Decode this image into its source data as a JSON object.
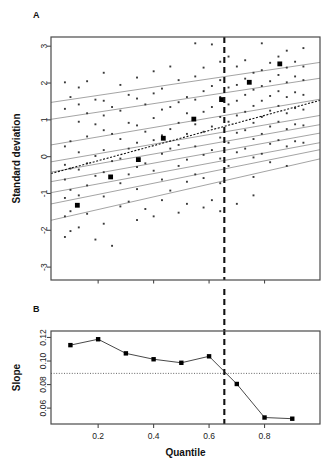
{
  "figure": {
    "panel_a_letter": "A",
    "panel_b_letter": "B",
    "panel_a_ylabel": "Standard deviation",
    "panel_b_ylabel": "Slope",
    "xlabel": "Quantile"
  },
  "chart_data": [
    {
      "id": "panel_a",
      "type": "scatter",
      "title": "A",
      "xlabel": "",
      "ylabel": "Standard deviation",
      "xlim": [
        0.03,
        1.0
      ],
      "ylim": [
        -3.35,
        3.25
      ],
      "yticks": [
        -3,
        -2,
        -1,
        0,
        1,
        2,
        3
      ],
      "ytick_labels": [
        "-3",
        "-2",
        "-1",
        "0",
        "1",
        "2",
        "3"
      ],
      "xticks": [
        0.2,
        0.4,
        0.6,
        0.8
      ],
      "xtick_labels": [],
      "grid": false,
      "legend": "none",
      "annotations": [
        {
          "type": "vline",
          "x": 0.655,
          "style": "dashed",
          "label": "selected quantile threshold"
        }
      ],
      "quantile_lines": [
        {
          "quantile": 0.1,
          "intercept": -1.78,
          "slope": 1.72
        },
        {
          "quantile": 0.2,
          "intercept": -1.33,
          "slope": 1.52
        },
        {
          "quantile": 0.3,
          "intercept": -1.02,
          "slope": 1.4
        },
        {
          "quantile": 0.4,
          "intercept": -0.72,
          "slope": 1.36
        },
        {
          "quantile": 0.5,
          "intercept": -0.46,
          "slope": 1.33
        },
        {
          "quantile": 0.6,
          "intercept": -0.18,
          "slope": 1.3
        },
        {
          "quantile": 0.7,
          "intercept": 0.28,
          "slope": 1.28
        },
        {
          "quantile": 0.8,
          "intercept": 0.98,
          "slope": 1.15
        },
        {
          "quantile": 0.9,
          "intercept": 1.44,
          "slope": 1.12
        }
      ],
      "ols_line": {
        "intercept": -0.52,
        "slope": 2.05,
        "style": "dotted"
      },
      "highlighted_points": [
        {
          "x": 0.125,
          "y": -1.32
        },
        {
          "x": 0.245,
          "y": -0.55
        },
        {
          "x": 0.345,
          "y": -0.08
        },
        {
          "x": 0.435,
          "y": 0.5
        },
        {
          "x": 0.545,
          "y": 1.02
        },
        {
          "x": 0.645,
          "y": 1.55
        },
        {
          "x": 0.745,
          "y": 2.02
        },
        {
          "x": 0.855,
          "y": 2.52
        }
      ],
      "scatter": {
        "x": [
          0.08,
          0.08,
          0.08,
          0.08,
          0.08,
          0.08,
          0.08,
          0.08,
          0.1,
          0.1,
          0.1,
          0.1,
          0.1,
          0.1,
          0.13,
          0.13,
          0.13,
          0.13,
          0.13,
          0.13,
          0.13,
          0.16,
          0.16,
          0.16,
          0.16,
          0.16,
          0.16,
          0.19,
          0.19,
          0.19,
          0.19,
          0.19,
          0.22,
          0.22,
          0.22,
          0.22,
          0.22,
          0.22,
          0.22,
          0.22,
          0.25,
          0.25,
          0.25,
          0.25,
          0.25,
          0.28,
          0.28,
          0.28,
          0.28,
          0.28,
          0.28,
          0.31,
          0.31,
          0.31,
          0.31,
          0.31,
          0.34,
          0.34,
          0.34,
          0.34,
          0.34,
          0.34,
          0.34,
          0.37,
          0.37,
          0.37,
          0.37,
          0.4,
          0.4,
          0.4,
          0.4,
          0.4,
          0.4,
          0.43,
          0.43,
          0.43,
          0.43,
          0.43,
          0.43,
          0.46,
          0.46,
          0.46,
          0.46,
          0.46,
          0.49,
          0.49,
          0.49,
          0.49,
          0.49,
          0.49,
          0.52,
          0.52,
          0.52,
          0.52,
          0.52,
          0.52,
          0.55,
          0.55,
          0.55,
          0.55,
          0.55,
          0.55,
          0.58,
          0.58,
          0.58,
          0.58,
          0.58,
          0.58,
          0.58,
          0.61,
          0.61,
          0.61,
          0.61,
          0.61,
          0.61,
          0.64,
          0.64,
          0.64,
          0.64,
          0.64,
          0.64,
          0.64,
          0.64,
          0.67,
          0.67,
          0.67,
          0.67,
          0.67,
          0.67,
          0.7,
          0.7,
          0.7,
          0.7,
          0.7,
          0.7,
          0.7,
          0.73,
          0.73,
          0.73,
          0.73,
          0.73,
          0.73,
          0.76,
          0.76,
          0.76,
          0.76,
          0.76,
          0.76,
          0.76,
          0.76,
          0.79,
          0.79,
          0.79,
          0.79,
          0.79,
          0.79,
          0.79,
          0.82,
          0.82,
          0.82,
          0.82,
          0.82,
          0.82,
          0.82,
          0.85,
          0.85,
          0.85,
          0.85,
          0.85,
          0.85,
          0.88,
          0.88,
          0.88,
          0.88,
          0.88,
          0.88,
          0.88,
          0.88,
          0.91,
          0.91,
          0.91,
          0.91,
          0.91,
          0.91,
          0.94,
          0.94,
          0.94,
          0.94,
          0.94,
          0.94,
          0.94
        ],
        "y": [
          2.02,
          1.3,
          0.28,
          -0.22,
          -0.62,
          -1.12,
          -1.62,
          -2.18,
          1.62,
          0.42,
          -0.32,
          -0.9,
          -1.48,
          -2.02,
          1.88,
          1.42,
          0.95,
          0.12,
          -0.35,
          -1.05,
          -1.92,
          2.05,
          1.18,
          0.55,
          -0.18,
          -0.78,
          -1.55,
          1.55,
          0.88,
          0.02,
          -0.52,
          -2.25,
          2.28,
          1.52,
          1.12,
          0.72,
          0.18,
          -0.42,
          -1.08,
          -1.82,
          1.35,
          0.62,
          -0.12,
          -0.58,
          -2.42,
          1.95,
          1.25,
          0.48,
          -0.05,
          -0.72,
          -1.35,
          1.68,
          0.92,
          0.22,
          -0.48,
          -1.22,
          2.15,
          1.58,
          0.85,
          0.38,
          -0.28,
          -0.88,
          -1.72,
          1.42,
          0.68,
          -0.18,
          -1.42,
          2.32,
          1.72,
          1.05,
          0.45,
          -0.38,
          -1.62,
          1.85,
          1.28,
          0.58,
          0.08,
          -0.62,
          -1.18,
          2.45,
          1.35,
          0.75,
          0.22,
          -0.92,
          2.08,
          1.48,
          0.92,
          0.32,
          -0.25,
          -1.52,
          1.62,
          1.18,
          0.62,
          -0.08,
          -0.68,
          -1.28,
          3.08,
          2.18,
          1.55,
          0.88,
          0.28,
          -0.48,
          2.42,
          1.78,
          1.22,
          0.68,
          0.05,
          -0.58,
          -1.38,
          3.05,
          1.92,
          1.35,
          0.82,
          0.18,
          -1.18,
          2.58,
          2.08,
          1.62,
          1.08,
          0.52,
          -0.05,
          -0.72,
          -1.48,
          2.72,
          1.88,
          1.42,
          0.95,
          0.38,
          -0.25,
          2.45,
          1.95,
          1.52,
          1.12,
          0.65,
          0.12,
          -1.28,
          2.62,
          2.12,
          1.68,
          1.22,
          0.72,
          0.22,
          2.28,
          1.82,
          1.38,
          0.92,
          0.48,
          -0.02,
          -0.55,
          -1.05,
          3.08,
          2.35,
          1.92,
          1.52,
          1.08,
          0.62,
          0.08,
          2.55,
          2.05,
          1.65,
          1.25,
          0.82,
          0.35,
          -0.15,
          2.72,
          2.22,
          1.78,
          1.38,
          0.95,
          0.45,
          2.88,
          2.42,
          2.02,
          1.62,
          1.18,
          0.75,
          0.28,
          -0.25,
          2.58,
          2.18,
          1.75,
          1.32,
          0.88,
          0.42,
          2.95,
          2.45,
          2.08,
          1.68,
          1.28,
          0.85,
          0.38
        ]
      }
    },
    {
      "id": "panel_b",
      "type": "line",
      "title": "B",
      "xlabel": "Quantile",
      "ylabel": "Slope",
      "xlim": [
        0.03,
        1.0
      ],
      "ylim": [
        0.0465,
        0.1255
      ],
      "yticks": [
        0.06,
        0.08,
        0.1,
        0.12
      ],
      "ytick_labels": [
        "0.06",
        "0.08",
        "0.10",
        "0.12"
      ],
      "xticks": [
        0.2,
        0.4,
        0.6,
        0.8
      ],
      "xtick_labels": [
        "0.2",
        "0.4",
        "0.6",
        "0.8"
      ],
      "grid": false,
      "legend": "none",
      "x": [
        0.1,
        0.2,
        0.3,
        0.4,
        0.5,
        0.6,
        0.7,
        0.8,
        0.9
      ],
      "values": [
        0.1135,
        0.1185,
        0.1065,
        0.1015,
        0.0985,
        0.104,
        0.0805,
        0.052,
        0.051
      ],
      "annotations": [
        {
          "type": "vline",
          "x": 0.655,
          "style": "dashed",
          "label": "selected quantile threshold"
        },
        {
          "type": "hline",
          "y": 0.0895,
          "style": "dotted",
          "label": "reference slope"
        }
      ]
    }
  ]
}
